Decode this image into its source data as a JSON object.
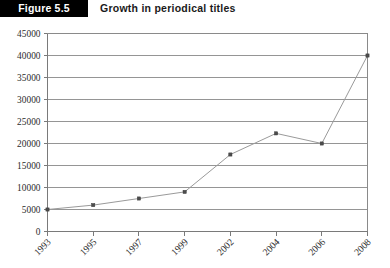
{
  "header": {
    "badge": "Figure 5.5",
    "title": "Growth in periodical titles"
  },
  "chart_data": {
    "type": "line",
    "title": "Growth in periodical titles",
    "xlabel": "",
    "ylabel": "",
    "categories": [
      "1993",
      "1995",
      "1997",
      "1999",
      "2002",
      "2004",
      "2006",
      "2008"
    ],
    "values": [
      5000,
      6000,
      7500,
      9000,
      17500,
      22300,
      20000,
      40000
    ],
    "series": [
      {
        "name": "Periodical titles",
        "values": [
          5000,
          6000,
          7500,
          9000,
          17500,
          22300,
          20000,
          40000
        ]
      }
    ],
    "ylim": [
      0,
      45000
    ],
    "yticks": [
      0,
      5000,
      10000,
      15000,
      20000,
      25000,
      30000,
      35000,
      40000,
      45000
    ],
    "ytick_labels": [
      "0",
      "5000",
      "10000",
      "15000",
      "20000",
      "25000",
      "30000",
      "35000",
      "40000",
      "45000"
    ],
    "grid": true,
    "grid_axis": "y",
    "legend": false,
    "legend_position": "none",
    "markers": true,
    "line_color": "#9a9a9a",
    "marker_color": "#4d4d4d",
    "grid_color": "#8a8a8a",
    "xtick_label_rotation": 45
  }
}
